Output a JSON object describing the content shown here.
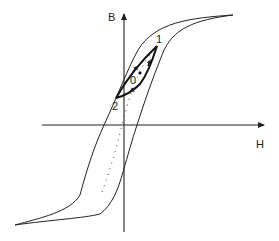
{
  "diagram": {
    "type": "hysteresis-loop",
    "axes": {
      "vertical_label": "B",
      "horizontal_label": "H"
    },
    "points": [
      {
        "label": "1",
        "desc": "upper tip of minor loop"
      },
      {
        "label": "0",
        "desc": "center of minor loop"
      },
      {
        "label": "2",
        "desc": "lower tip of minor loop"
      }
    ],
    "colors": {
      "stroke": "#222222",
      "background": "#ffffff"
    }
  }
}
